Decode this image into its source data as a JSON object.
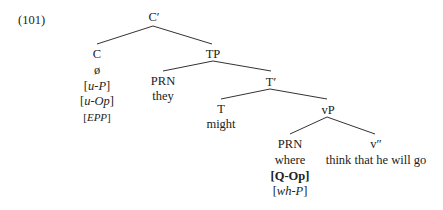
{
  "example_number": "(101)",
  "nodes": {
    "c_bar": "C′",
    "c": "C",
    "c_null": "ø",
    "c_feat1_pre": "[",
    "c_feat1": "u-P",
    "c_feat1_post": "]",
    "c_feat2_pre": "[",
    "c_feat2": "u-Op",
    "c_feat2_post": "]",
    "c_feat3_pre": "[",
    "c_feat3": "EPP",
    "c_feat3_post": "]",
    "tp": "TP",
    "prn1": "PRN",
    "prn1_word": "they",
    "t_bar": "T′",
    "t": "T",
    "t_word": "might",
    "vp": "vP",
    "prn2": "PRN",
    "prn2_word": "where",
    "prn2_feat1": "[Q-Op]",
    "prn2_feat2_pre": "[",
    "prn2_feat2": "wh-P",
    "prn2_feat2_post": "]",
    "v_dbar": "v″",
    "v_dbar_words": "think that he will go"
  }
}
